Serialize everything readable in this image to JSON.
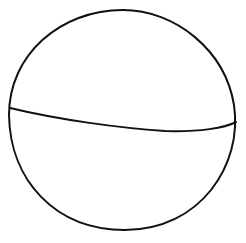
{
  "diagram": {
    "stroke_color": "#111111",
    "background": "#ffffff",
    "stroke_width": 2,
    "shapes": {
      "outline": {
        "type": "ellipse",
        "path": "M 123 10 C 175 10 225 50 234 105 C 243 165 200 230 125 230 C 55 230 10 180 9 115 C 9 55 60 10 123 10 Z"
      },
      "divider": {
        "type": "curve",
        "path": "M 10 108 C 60 120 120 128 165 131 C 200 132 225 128 236 122"
      }
    }
  }
}
